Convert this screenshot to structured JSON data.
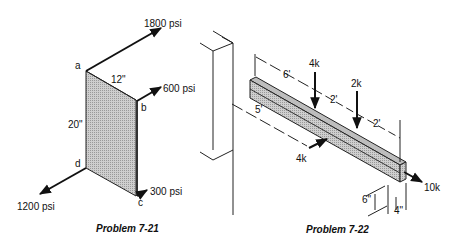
{
  "figures": [
    {
      "id": "7-21",
      "caption": "Problem 7-21",
      "corners": {
        "a": "a",
        "b": "b",
        "c": "c",
        "d": "d"
      },
      "dimensions": {
        "width": "12\"",
        "height": "20\""
      },
      "loads": [
        {
          "label": "1800 psi",
          "at": "a"
        },
        {
          "label": "600 psi",
          "at": "b"
        },
        {
          "label": "300 psi",
          "at": "c"
        },
        {
          "label": "1200 psi",
          "at": "d"
        }
      ]
    },
    {
      "id": "7-22",
      "caption": "Problem 7-22",
      "dimensions": {
        "d1": "6'",
        "d2": "2'",
        "d3": "2'",
        "d4": "5'",
        "depth": "6\"",
        "width": "4\""
      },
      "loads": [
        {
          "label": "4k",
          "direction": "down"
        },
        {
          "label": "2k",
          "direction": "down"
        },
        {
          "label": "4k",
          "direction": "lateral"
        },
        {
          "label": "10k",
          "direction": "axial"
        }
      ]
    }
  ]
}
